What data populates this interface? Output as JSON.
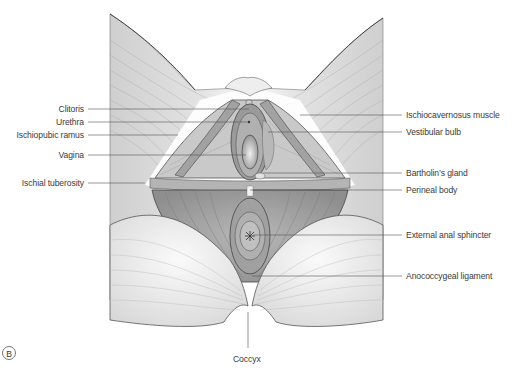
{
  "figure": {
    "panel_label": "B",
    "colors": {
      "background": "#ffffff",
      "skin_fill": "#e4e4e4",
      "muscle_fill": "#a9a9a9",
      "muscle_dark": "#8a8a8a",
      "line": "#555555",
      "text": "#3a3a3a"
    }
  },
  "labels": {
    "left": [
      {
        "text": "Clitoris",
        "x_end": 84,
        "y": 109,
        "target_x": 249,
        "target_y": 109
      },
      {
        "text": "Urethra",
        "x_end": 84,
        "y": 122,
        "target_x": 248,
        "target_y": 122
      },
      {
        "text": "Ischiopubic ramus",
        "x_end": 84,
        "y": 135,
        "target_x": 178,
        "target_y": 135
      },
      {
        "text": "Vagina",
        "x_end": 84,
        "y": 155,
        "target_x": 246,
        "target_y": 155
      },
      {
        "text": "Ischial tuberosity",
        "x_end": 84,
        "y": 183,
        "target_x": 145,
        "target_y": 183
      }
    ],
    "right": [
      {
        "text": "Ischiocavernosus muscle",
        "x_start": 406,
        "y": 115,
        "target_x": 300,
        "target_y": 115
      },
      {
        "text": "Vestibular bulb",
        "x_start": 406,
        "y": 132,
        "target_x": 268,
        "target_y": 132
      },
      {
        "text": "Bartholin’s gland",
        "x_start": 406,
        "y": 173,
        "target_x": 263,
        "target_y": 173
      },
      {
        "text": "Perineal body",
        "x_start": 406,
        "y": 190,
        "target_x": 250,
        "target_y": 190
      },
      {
        "text": "External anal sphincter",
        "x_start": 406,
        "y": 235,
        "target_x": 253,
        "target_y": 235
      },
      {
        "text": "Anococcygeal ligament",
        "x_start": 406,
        "y": 276,
        "target_x": 252,
        "target_y": 276
      }
    ],
    "bottom": [
      {
        "text": "Coccyx",
        "x_center": 248,
        "y": 360,
        "target_x": 248,
        "target_y": 312
      }
    ]
  }
}
